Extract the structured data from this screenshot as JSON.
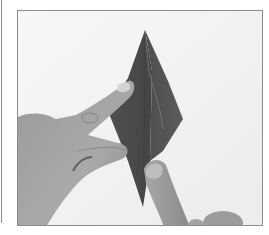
{
  "image": {
    "description": "Grayscale photograph of hands folding a dark origami paper into a tall diamond (kite) shape on a white surface",
    "alt": "Origami folding step: left hand index finger presses the left flap while right index finger holds the bottom point of the diamond"
  },
  "colors": {
    "background": "#f4f4f4",
    "paper_dark": "#4a4a4a",
    "paper_mid": "#5a5a5a",
    "skin_light": "#b8b8b8",
    "skin_mid": "#8f8f8f",
    "frame_border": "#8c8c8c"
  }
}
